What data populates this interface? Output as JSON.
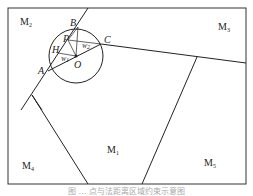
{
  "figure": {
    "regions": [
      "M2",
      "M3",
      "M1",
      "M4",
      "M5"
    ],
    "points": [
      "A",
      "B",
      "C",
      "H",
      "P",
      "O"
    ],
    "angles": [
      "W1",
      "W2"
    ],
    "caption": "图 … 点与法距离区域约束示意图"
  }
}
